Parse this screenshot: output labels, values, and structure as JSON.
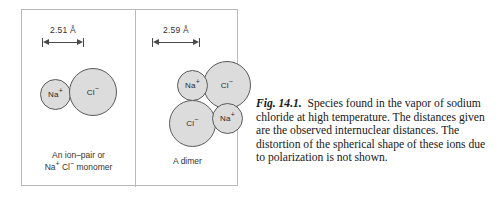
{
  "figure": {
    "panels": [
      {
        "name": "monomer",
        "dimension": "2.51 Å",
        "caption_line1": "An ion–pair or",
        "caption_line2_prefix": "Na",
        "caption_line2_sup1": "+",
        "caption_line2_mid": " Cl",
        "caption_line2_sup2": "−",
        "caption_line2_suffix": " monomer",
        "ions": [
          {
            "species": "Na",
            "charge": "+"
          },
          {
            "species": "Cl",
            "charge": "−"
          }
        ]
      },
      {
        "name": "dimer",
        "dimension": "2.59 Å",
        "caption_line1": "A dimer",
        "ions": [
          {
            "species": "Na",
            "charge": "+"
          },
          {
            "species": "Cl",
            "charge": "−"
          },
          {
            "species": "Cl",
            "charge": "−"
          },
          {
            "species": "Na",
            "charge": "+"
          }
        ]
      }
    ]
  },
  "legend": {
    "figure_number": "Fig. 14.1.",
    "text": "Species found in the vapor of sodium chloride at high temperature. The distances given are the observed internuclear distances. The distortion of the spherical shape of these ions due to polarization is not shown."
  },
  "colors": {
    "sphere_fill": "#dcdcdc",
    "sphere_stroke": "#5a5a5a",
    "frame": "#b9b9b9",
    "text": "#171717"
  }
}
